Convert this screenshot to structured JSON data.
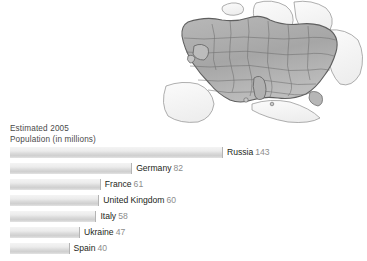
{
  "chart_data": {
    "type": "bar",
    "title": "Estimated 2005 Population (in millions)",
    "title_line1": "Estimated 2005",
    "title_line2": "Population (in millions)",
    "orientation": "horizontal",
    "xlabel": "",
    "ylabel": "",
    "grid": false,
    "legend": false,
    "xlim": [
      0,
      143
    ],
    "units": "millions",
    "categories": [
      "Russia",
      "Germany",
      "France",
      "United Kingdom",
      "Italy",
      "Ukraine",
      "Spain"
    ],
    "values": [
      143,
      82,
      61,
      60,
      58,
      47,
      40
    ],
    "bars": [
      {
        "country": "Russia",
        "value": 143
      },
      {
        "country": "Germany",
        "value": 82
      },
      {
        "country": "France",
        "value": 61
      },
      {
        "country": "United Kingdom",
        "value": 60
      },
      {
        "country": "Italy",
        "value": 58
      },
      {
        "country": "Ukraine",
        "value": 47
      },
      {
        "country": "Spain",
        "value": 40
      }
    ],
    "colors": {
      "bar_fill_light": "#f4f4f4",
      "bar_fill_dark": "#cfcfcf",
      "bar_edge": "#b4b4b4",
      "country_text": "#231f20",
      "value_text": "#8d8d8d",
      "title_text": "#4a4a4a",
      "background": "#ffffff"
    }
  },
  "map": {
    "name": "europe-map",
    "region": "Europe",
    "colors": {
      "highlight_fill": "#a9a9a9",
      "base_fill": "#f0f0f0",
      "border": "#6f6f6f"
    }
  }
}
